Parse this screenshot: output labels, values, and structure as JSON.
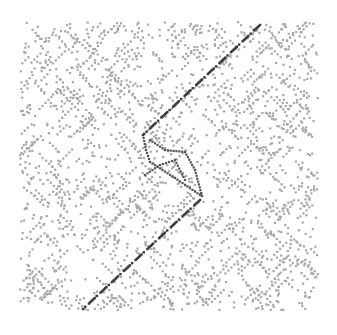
{
  "figure": {
    "type": "dot-plot",
    "plot_area": {
      "x0": 20,
      "y0": 22,
      "x1": 318,
      "y1": 310
    },
    "colors": {
      "background": "#ffffff",
      "noise_dots": "#a8a8a8",
      "diagonal": "#3a3a3a",
      "loop": "#555555"
    },
    "diagonal_segments": [
      {
        "from": [
          260,
          25
        ],
        "to": [
          143,
          135
        ],
        "style": "dash-dot"
      },
      {
        "from": [
          200,
          200
        ],
        "to": [
          83,
          309
        ],
        "style": "dash-dot"
      }
    ],
    "loop_paths": [
      [
        [
          143,
          135
        ],
        [
          146,
          150
        ],
        [
          150,
          162
        ],
        [
          175,
          178
        ],
        [
          200,
          195
        ]
      ],
      [
        [
          150,
          140
        ],
        [
          165,
          150
        ],
        [
          185,
          152
        ],
        [
          195,
          170
        ],
        [
          202,
          196
        ]
      ],
      [
        [
          145,
          175
        ],
        [
          160,
          165
        ],
        [
          175,
          160
        ],
        [
          185,
          180
        ]
      ]
    ],
    "dot_count": 2600
  }
}
